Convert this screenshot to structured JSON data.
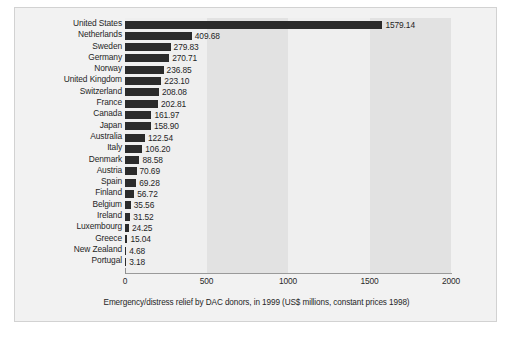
{
  "chart_data": {
    "type": "bar",
    "orientation": "horizontal",
    "title": "",
    "caption": "Emergency/distress relief by DAC donors, in 1999 (US$ millions, constant prices 1998)",
    "xlabel": "",
    "ylabel": "",
    "xlim": [
      0,
      2000
    ],
    "xticks": [
      0,
      500,
      1000,
      1500,
      2000
    ],
    "xtick_labels": [
      "0",
      "500",
      "1000",
      "1500",
      "2000"
    ],
    "grid": false,
    "legend": "none",
    "bar_color": "#2b2b2b",
    "plot_background": "#ececec",
    "figure_background": "#f2f2f2",
    "categories": [
      "United States",
      "Netherlands",
      "Sweden",
      "Germany",
      "Norway",
      "United Kingdom",
      "Switzerland",
      "France",
      "Canada",
      "Japan",
      "Australia",
      "Italy",
      "Denmark",
      "Austria",
      "Spain",
      "Finland",
      "Belgium",
      "Ireland",
      "Luxembourg",
      "Greece",
      "New Zealand",
      "Portugal"
    ],
    "values": [
      1579.14,
      409.68,
      279.83,
      270.71,
      236.85,
      223.1,
      208.08,
      202.81,
      161.97,
      158.9,
      122.54,
      106.2,
      88.58,
      70.69,
      69.28,
      56.72,
      35.56,
      31.52,
      24.25,
      15.04,
      4.68,
      3.18
    ],
    "value_labels": [
      "1579.14",
      "409.68",
      "279.83",
      "270.71",
      "236.85",
      "223.10",
      "208.08",
      "202.81",
      "161.97",
      "158.90",
      "122.54",
      "106.20",
      "88.58",
      "70.69",
      "69.28",
      "56.72",
      "35.56",
      "31.52",
      "24.25",
      "15.04",
      "4.68",
      "3.18"
    ]
  }
}
